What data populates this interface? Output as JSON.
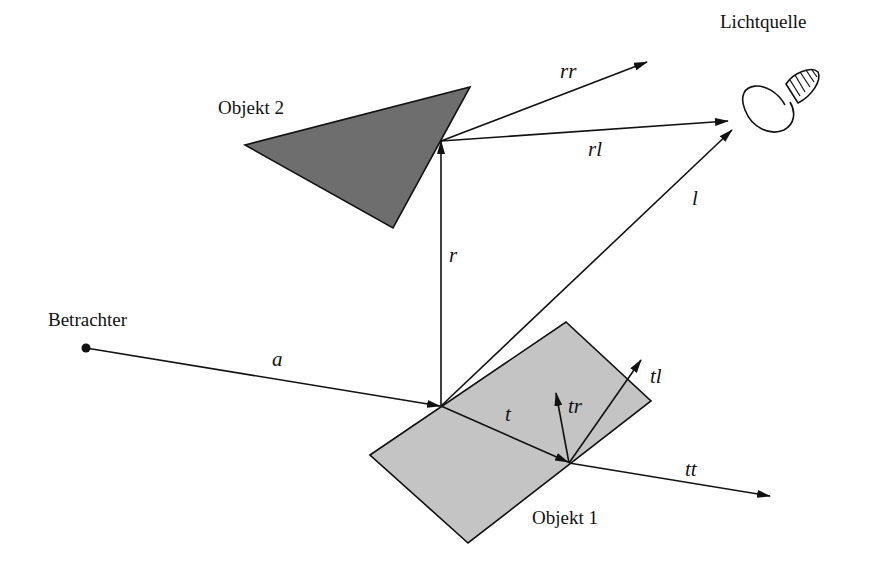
{
  "diagram": {
    "labels": {
      "light_source": "Lichtquelle",
      "object2": "Objekt 2",
      "object1": "Objekt 1",
      "viewer": "Betrachter"
    },
    "vectors": {
      "a": "a",
      "r": "r",
      "l": "l",
      "t": "t",
      "rr": "rr",
      "rl": "rl",
      "tr": "tr",
      "tl": "tl",
      "tt": "tt"
    },
    "colors": {
      "object1_fill": "#c4c4c4",
      "object2_fill": "#6e6e6e",
      "stroke": "#111111",
      "background": "#ffffff"
    }
  }
}
